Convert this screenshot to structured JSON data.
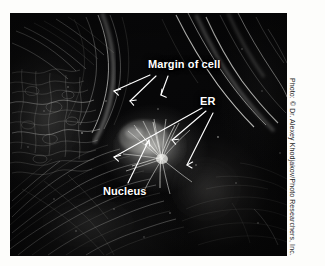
{
  "figure": {
    "type": "light-micrograph",
    "background_color": "#fdfdfb",
    "plate_color": "#050506",
    "label_color": "#ffffff",
    "leader_color": "#ffffff"
  },
  "labels": [
    {
      "id": "margin-of-cell",
      "text": "Margin of cell",
      "x": 138,
      "y": 45,
      "arrow_count": 3
    },
    {
      "id": "er",
      "text": "ER",
      "x": 190,
      "y": 82,
      "arrow_count": 3
    },
    {
      "id": "nucleus",
      "text": "Nucleus",
      "x": 93,
      "y": 172,
      "arrow_count": 1
    }
  ],
  "credit": {
    "text": "Photo: © Dr. Alexey Khodjakov/Photo Researchers, Inc.",
    "orientation": "vertical",
    "color": "#1b1b1b"
  }
}
